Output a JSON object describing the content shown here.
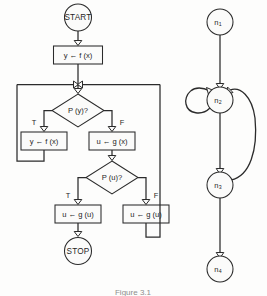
{
  "figure": {
    "caption": "Figure 3.1",
    "background_color": "#fdfdfc",
    "ink_color": "#2b2b2b"
  },
  "flowchart": {
    "title": "Flowchart",
    "start": {
      "label": "START"
    },
    "stop": {
      "label": "STOP"
    },
    "process_1": {
      "label": "y ← f (x)"
    },
    "decision_1": {
      "label": "P (y)?"
    },
    "decision_1_true_label": "T",
    "decision_1_false_label": "F",
    "process_true_1": {
      "label": "y ← f (x)"
    },
    "process_false_1": {
      "label": "u ← g (x)"
    },
    "decision_2": {
      "label": "P (u)?"
    },
    "decision_2_true_label": "T",
    "decision_2_false_label": "F",
    "process_true_2": {
      "label": "u ← g (u)"
    },
    "process_false_2": {
      "label": "u ← g (u)"
    }
  },
  "flowgraph": {
    "title": "Flow graph",
    "nodes": [
      {
        "base": "n",
        "sub": "1"
      },
      {
        "base": "n",
        "sub": "2"
      },
      {
        "base": "n",
        "sub": "3"
      },
      {
        "base": "n",
        "sub": "4"
      }
    ],
    "edges": [
      {
        "from": "n1",
        "to": "n2",
        "kind": "straight"
      },
      {
        "from": "n2",
        "to": "n2",
        "kind": "self-loop"
      },
      {
        "from": "n2",
        "to": "n3",
        "kind": "straight"
      },
      {
        "from": "n3",
        "to": "n2",
        "kind": "back-edge"
      },
      {
        "from": "n3",
        "to": "n4",
        "kind": "straight"
      }
    ]
  }
}
